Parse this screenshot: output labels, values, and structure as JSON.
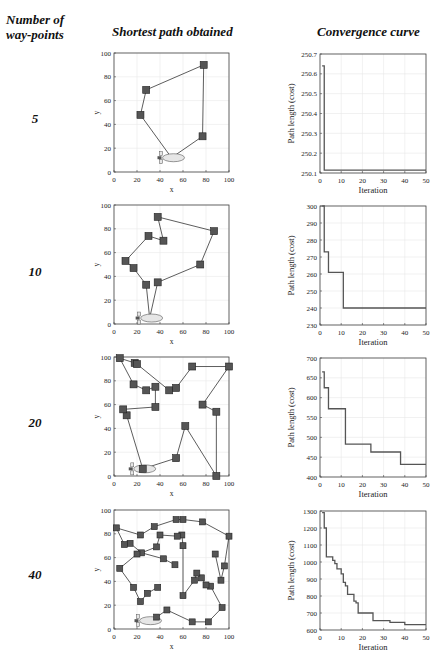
{
  "headers": {
    "col1": "Number of way-points",
    "col1_line1": "Number of",
    "col1_line2": "way-points",
    "col2": "Shortest path obtained",
    "col3": "Convergence curve"
  },
  "colors": {
    "waypoint_fill": "#555555",
    "waypoint_stroke": "#222222",
    "path_line": "#333333",
    "airship_fill": "#e6e6e6",
    "grid": "#e8e8e8",
    "curve": "#555555"
  },
  "rows": [
    {
      "label": "5"
    },
    {
      "label": "10"
    },
    {
      "label": "20"
    },
    {
      "label": "40"
    }
  ],
  "chart_data": [
    {
      "type": "scatter",
      "title": "Shortest path obtained (5 way-points)",
      "xlabel": "x",
      "ylabel": "y",
      "xlim": [
        0,
        100
      ],
      "ylim": [
        0,
        100
      ],
      "xticks": [
        0,
        20,
        40,
        60,
        80,
        100
      ],
      "yticks": [
        0,
        20,
        40,
        60,
        80,
        100
      ],
      "start": [
        50,
        12
      ],
      "path": [
        [
          50,
          12
        ],
        [
          23,
          48
        ],
        [
          28,
          69
        ],
        [
          78,
          90
        ],
        [
          77,
          30
        ],
        [
          50,
          12
        ]
      ],
      "waypoints": [
        [
          23,
          48
        ],
        [
          28,
          69
        ],
        [
          78,
          90
        ],
        [
          77,
          30
        ]
      ]
    },
    {
      "type": "line",
      "title": "Convergence curve (5 way-points)",
      "xlabel": "Iteration",
      "ylabel": "Path length (cost)",
      "xlim": [
        0,
        50
      ],
      "ylim": [
        250.1,
        250.7
      ],
      "xticks": [
        0,
        10,
        20,
        30,
        40,
        50
      ],
      "yticks": [
        250.1,
        250.2,
        250.3,
        250.4,
        250.5,
        250.6,
        250.7
      ],
      "x": [
        1,
        2,
        2,
        50
      ],
      "y": [
        250.64,
        250.64,
        250.115,
        250.115
      ]
    },
    {
      "type": "scatter",
      "title": "Shortest path obtained (10 way-points)",
      "xlabel": "x",
      "ylabel": "y",
      "xlim": [
        0,
        100
      ],
      "ylim": [
        0,
        100
      ],
      "xticks": [
        0,
        20,
        40,
        60,
        80,
        100
      ],
      "yticks": [
        0,
        20,
        40,
        60,
        80,
        100
      ],
      "start": [
        31,
        5
      ],
      "path": [
        [
          31,
          5
        ],
        [
          28,
          33
        ],
        [
          17,
          47
        ],
        [
          10,
          53
        ],
        [
          30,
          74
        ],
        [
          43,
          70
        ],
        [
          38,
          90
        ],
        [
          87,
          78
        ],
        [
          75,
          50
        ],
        [
          38,
          35
        ],
        [
          31,
          5
        ]
      ],
      "waypoints": [
        [
          28,
          33
        ],
        [
          17,
          47
        ],
        [
          10,
          53
        ],
        [
          30,
          74
        ],
        [
          43,
          70
        ],
        [
          38,
          90
        ],
        [
          87,
          78
        ],
        [
          75,
          50
        ],
        [
          38,
          35
        ]
      ]
    },
    {
      "type": "line",
      "title": "Convergence curve (10 way-points)",
      "xlabel": "Iteration",
      "ylabel": "Path length (cost)",
      "xlim": [
        0,
        50
      ],
      "ylim": [
        230,
        300
      ],
      "xticks": [
        0,
        10,
        20,
        30,
        40,
        50
      ],
      "yticks": [
        230,
        240,
        250,
        260,
        270,
        280,
        290,
        300
      ],
      "x": [
        1,
        2,
        2,
        3,
        4,
        10,
        11,
        50
      ],
      "y": [
        300,
        273,
        273,
        273,
        261,
        261,
        240,
        240
      ]
    },
    {
      "type": "scatter",
      "title": "Shortest path obtained (20 way-points)",
      "xlabel": "x",
      "ylabel": "y",
      "xlim": [
        0,
        100
      ],
      "ylim": [
        0,
        100
      ],
      "xticks": [
        0,
        20,
        40,
        60,
        80,
        100
      ],
      "yticks": [
        0,
        20,
        40,
        60,
        80,
        100
      ],
      "start": [
        25,
        6
      ],
      "path": [
        [
          25,
          6
        ],
        [
          11,
          51
        ],
        [
          8,
          56
        ],
        [
          36,
          58
        ],
        [
          36,
          75
        ],
        [
          28,
          72
        ],
        [
          17,
          77
        ],
        [
          5,
          99
        ],
        [
          18,
          95
        ],
        [
          20,
          94
        ],
        [
          48,
          72
        ],
        [
          54,
          74
        ],
        [
          68,
          92
        ],
        [
          100,
          92
        ],
        [
          77,
          60
        ],
        [
          89,
          54
        ],
        [
          89,
          0
        ],
        [
          62,
          42
        ],
        [
          54,
          15
        ],
        [
          25,
          6
        ]
      ],
      "waypoints": [
        [
          11,
          51
        ],
        [
          8,
          56
        ],
        [
          36,
          58
        ],
        [
          36,
          75
        ],
        [
          28,
          72
        ],
        [
          17,
          77
        ],
        [
          5,
          99
        ],
        [
          18,
          95
        ],
        [
          20,
          94
        ],
        [
          48,
          72
        ],
        [
          54,
          74
        ],
        [
          68,
          92
        ],
        [
          100,
          92
        ],
        [
          77,
          60
        ],
        [
          89,
          54
        ],
        [
          89,
          0
        ],
        [
          62,
          42
        ],
        [
          54,
          15
        ],
        [
          25,
          6
        ]
      ]
    },
    {
      "type": "line",
      "title": "Convergence curve (20 way-points)",
      "xlabel": "Iteration",
      "ylabel": "Path length (cost)",
      "xlim": [
        0,
        50
      ],
      "ylim": [
        400,
        700
      ],
      "xticks": [
        0,
        10,
        20,
        30,
        40,
        50
      ],
      "yticks": [
        400,
        450,
        500,
        550,
        600,
        650,
        700
      ],
      "x": [
        1,
        2,
        3,
        4,
        11,
        12,
        23,
        24,
        37,
        38,
        50
      ],
      "y": [
        665,
        625,
        625,
        572,
        572,
        483,
        483,
        463,
        463,
        432,
        432
      ]
    },
    {
      "type": "scatter",
      "title": "Shortest path obtained (40 way-points)",
      "xlabel": "x",
      "ylabel": "y",
      "xlim": [
        0,
        100
      ],
      "ylim": [
        0,
        100
      ],
      "xticks": [
        0,
        20,
        40,
        60,
        80,
        100
      ],
      "yticks": [
        0,
        20,
        40,
        60,
        80,
        100
      ],
      "start": [
        30,
        7
      ],
      "path": [
        [
          30,
          7
        ],
        [
          37,
          10
        ],
        [
          46,
          16
        ],
        [
          68,
          6
        ],
        [
          82,
          6
        ],
        [
          94,
          18
        ],
        [
          84,
          36
        ],
        [
          80,
          37
        ],
        [
          76,
          43
        ],
        [
          72,
          47
        ],
        [
          70,
          41
        ],
        [
          60,
          28
        ],
        [
          60,
          70
        ],
        [
          59,
          79
        ],
        [
          55,
          78
        ],
        [
          40,
          79
        ],
        [
          37,
          69
        ],
        [
          24,
          64
        ],
        [
          20,
          63
        ],
        [
          5,
          51
        ],
        [
          17,
          35
        ],
        [
          23,
          23
        ],
        [
          29,
          30
        ],
        [
          38,
          35
        ]
      ],
      "path2": [
        [
          53,
          54
        ],
        [
          43,
          59
        ],
        [
          24,
          64
        ],
        [
          14,
          72
        ],
        [
          9,
          71
        ],
        [
          2,
          85
        ],
        [
          23,
          79
        ],
        [
          35,
          86
        ],
        [
          54,
          92
        ],
        [
          60,
          92
        ],
        [
          77,
          90
        ],
        [
          100,
          78
        ],
        [
          96,
          53
        ],
        [
          93,
          41
        ],
        [
          88,
          63
        ]
      ],
      "waypoints": [
        [
          37,
          10
        ],
        [
          46,
          16
        ],
        [
          68,
          6
        ],
        [
          82,
          6
        ],
        [
          94,
          18
        ],
        [
          84,
          36
        ],
        [
          80,
          37
        ],
        [
          76,
          43
        ],
        [
          72,
          47
        ],
        [
          70,
          41
        ],
        [
          60,
          28
        ],
        [
          60,
          70
        ],
        [
          59,
          79
        ],
        [
          55,
          78
        ],
        [
          40,
          79
        ],
        [
          37,
          69
        ],
        [
          24,
          64
        ],
        [
          20,
          63
        ],
        [
          5,
          51
        ],
        [
          17,
          35
        ],
        [
          23,
          23
        ],
        [
          29,
          30
        ],
        [
          38,
          35
        ],
        [
          53,
          54
        ],
        [
          43,
          59
        ],
        [
          14,
          72
        ],
        [
          9,
          71
        ],
        [
          2,
          85
        ],
        [
          23,
          79
        ],
        [
          35,
          86
        ],
        [
          54,
          92
        ],
        [
          60,
          92
        ],
        [
          77,
          90
        ],
        [
          100,
          78
        ],
        [
          96,
          53
        ],
        [
          93,
          41
        ],
        [
          88,
          63
        ]
      ]
    },
    {
      "type": "line",
      "title": "Convergence curve (40 way-points)",
      "xlabel": "Iteration",
      "ylabel": "Path length (cost)",
      "xlim": [
        0,
        50
      ],
      "ylim": [
        600,
        1300
      ],
      "xticks": [
        0,
        10,
        20,
        30,
        40,
        50
      ],
      "yticks": [
        600,
        700,
        800,
        900,
        1000,
        1100,
        1200,
        1300
      ],
      "x": [
        1,
        2,
        3,
        5,
        6,
        7,
        8,
        9,
        10,
        11,
        12,
        13,
        15,
        16,
        17,
        18,
        24,
        25,
        32,
        33,
        39,
        40,
        50
      ],
      "y": [
        1290,
        1200,
        1030,
        1030,
        1010,
        990,
        960,
        960,
        930,
        880,
        860,
        810,
        810,
        770,
        760,
        700,
        700,
        655,
        655,
        645,
        645,
        632,
        632
      ]
    }
  ]
}
